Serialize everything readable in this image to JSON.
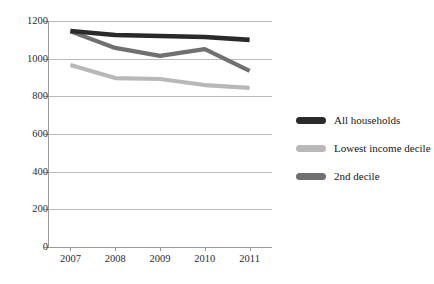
{
  "chart_data": {
    "type": "line",
    "title": "",
    "xlabel": "",
    "ylabel": "",
    "categories": [
      "2007",
      "2008",
      "2009",
      "2010",
      "2011"
    ],
    "ylim": [
      0,
      1200
    ],
    "yticks": [
      0,
      200,
      400,
      600,
      800,
      1000,
      1200
    ],
    "ytick_labels": [
      "0",
      "200",
      "400",
      "600",
      "800",
      "1000",
      "1200"
    ],
    "grid": true,
    "legend_position": "right",
    "series": [
      {
        "name": "All households",
        "color": "#2a2a2a",
        "values": [
          1147,
          1126,
          1120,
          1115,
          1100
        ]
      },
      {
        "name": "Lowest income decile",
        "color": "#b8b8b8",
        "values": [
          966,
          897,
          892,
          860,
          845
        ]
      },
      {
        "name": "2nd decile",
        "color": "#707070",
        "values": [
          1145,
          1057,
          1015,
          1051,
          935
        ]
      }
    ]
  },
  "legend": {
    "items": [
      {
        "label": "All households",
        "swatch_name": "legend-swatch-all-households"
      },
      {
        "label": "Lowest income decile",
        "swatch_name": "legend-swatch-lowest-income-decile"
      },
      {
        "label": "2nd decile",
        "swatch_name": "legend-swatch-2nd-decile"
      }
    ]
  },
  "axes": {
    "y_labels": [
      "1200",
      "1000",
      "800",
      "600",
      "400",
      "200",
      "0"
    ],
    "x_labels": [
      "2007",
      "2008",
      "2009",
      "2010",
      "2011"
    ]
  },
  "colors": {
    "all_households": "#2a2a2a",
    "lowest_income_decile": "#b8b8b8",
    "second_decile": "#707070",
    "grid": "#b9b9b9",
    "axis": "#9a9a9a",
    "text": "#2b2b2b"
  }
}
